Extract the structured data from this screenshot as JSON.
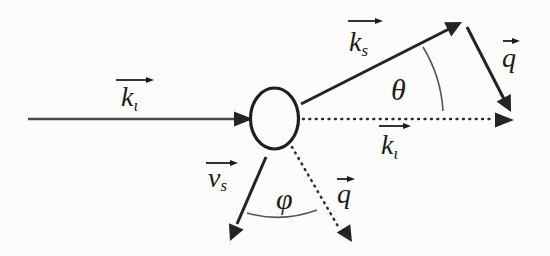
{
  "diagram": {
    "background_color": "#fcfcfa",
    "ink_color": "#242424",
    "labels": {
      "k_incident": {
        "symbol": "k",
        "subscript": "ι"
      },
      "k_scattered": {
        "symbol": "k",
        "subscript": "s"
      },
      "k_incident_dotted": {
        "symbol": "k",
        "subscript": "ι"
      },
      "q_upper": {
        "symbol": "q"
      },
      "q_lower": {
        "symbol": "q"
      },
      "v_sound": {
        "symbol": "v",
        "subscript": "s"
      },
      "theta_angle": {
        "symbol": "θ"
      },
      "phi_angle": {
        "symbol": "φ"
      }
    }
  }
}
